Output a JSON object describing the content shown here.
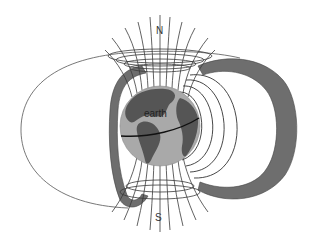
{
  "diagram": {
    "title": "",
    "labels": {
      "north": "N",
      "south": "S",
      "earth": "earth"
    },
    "elements": [
      {
        "name": "earth-globe",
        "description": "Earth showing the Americas with equator line"
      },
      {
        "name": "inner-belt",
        "description": "Dark gray crescent belt on the left side"
      },
      {
        "name": "outer-belt",
        "description": "Dark gray thick crescent belt on the right side"
      },
      {
        "name": "outer-field-loop",
        "description": "Large thin field loop extending left"
      },
      {
        "name": "dipole-field-lines",
        "description": "Nested field lines on the right of Earth"
      },
      {
        "name": "polar-field-lines",
        "description": "Field lines converging at N and S poles"
      },
      {
        "name": "north-polar-rings",
        "description": "Ellipse rings around north polar field lines"
      },
      {
        "name": "south-polar-rings",
        "description": "Ellipse rings around south polar field lines"
      }
    ],
    "colors": {
      "background": "#ffffff",
      "belt": "#6e6e6e",
      "ocean": "#a9a9a9",
      "land": "#555555",
      "line": "#3a3a3a",
      "equator": "#111111"
    }
  }
}
